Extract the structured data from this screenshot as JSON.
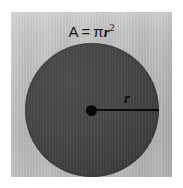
{
  "figure": {
    "name": "circle-area-diagram",
    "background_color": "#ffffff",
    "panel_color": "#bebebe",
    "circle_color": "#454545",
    "ink_color": "#0d0d0d"
  },
  "formula": {
    "area_symbol": "A",
    "equals": "=",
    "pi_symbol": "π",
    "radius_variable": "r",
    "exponent": "2",
    "full_text": "A = πr²"
  },
  "labels": {
    "radius": "r"
  },
  "geometry": {
    "circle_center_x": 91,
    "circle_center_y": 110,
    "circle_radius": 67,
    "radius_line_length": 67,
    "center_dot_radius": 5
  }
}
